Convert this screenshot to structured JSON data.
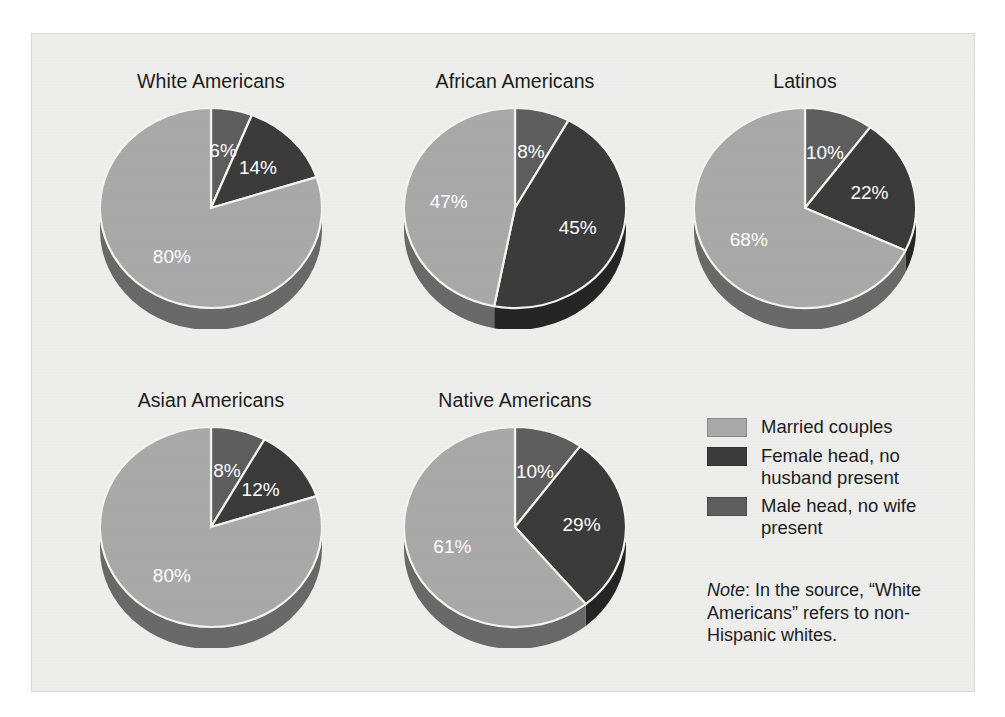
{
  "figure": {
    "background_color": "#eeeeec",
    "legend": {
      "items": [
        {
          "label": "Married couples",
          "color": "#a9a9a9",
          "key": "married"
        },
        {
          "label": "Female head, no husband present",
          "color": "#3b3b3b",
          "key": "female_head"
        },
        {
          "label": "Male head, no wife present",
          "color": "#5e5e5e",
          "key": "male_head"
        }
      ]
    },
    "note": {
      "lead": "Note",
      "text": ": In the source, “White Americans” refers to non-Hispanic whites."
    }
  },
  "chart_data": {
    "type": "pie",
    "title": "",
    "legend_position": "right",
    "categories": [
      "Male head, no wife present",
      "Female head, no husband present",
      "Married couples"
    ],
    "colors": [
      "#5e5e5e",
      "#3b3b3b",
      "#a9a9a9"
    ],
    "unit": "%",
    "charts": [
      {
        "title": "White Americans",
        "slices": [
          {
            "category": "Male head, no wife present",
            "value": 6,
            "label": "6%",
            "color": "#5e5e5e"
          },
          {
            "category": "Female head, no husband present",
            "value": 14,
            "label": "14%",
            "color": "#3b3b3b"
          },
          {
            "category": "Married couples",
            "value": 80,
            "label": "80%",
            "color": "#a9a9a9"
          }
        ]
      },
      {
        "title": "African Americans",
        "slices": [
          {
            "category": "Male head, no wife present",
            "value": 8,
            "label": "8%",
            "color": "#5e5e5e"
          },
          {
            "category": "Female head, no husband present",
            "value": 45,
            "label": "45%",
            "color": "#3b3b3b"
          },
          {
            "category": "Married couples",
            "value": 47,
            "label": "47%",
            "color": "#a9a9a9"
          }
        ]
      },
      {
        "title": "Latinos",
        "slices": [
          {
            "category": "Male head, no wife present",
            "value": 10,
            "label": "10%",
            "color": "#5e5e5e"
          },
          {
            "category": "Female head, no husband present",
            "value": 22,
            "label": "22%",
            "color": "#3b3b3b"
          },
          {
            "category": "Married couples",
            "value": 68,
            "label": "68%",
            "color": "#a9a9a9"
          }
        ]
      },
      {
        "title": "Asian Americans",
        "slices": [
          {
            "category": "Male head, no wife present",
            "value": 8,
            "label": "8%",
            "color": "#5e5e5e"
          },
          {
            "category": "Female head, no husband present",
            "value": 12,
            "label": "12%",
            "color": "#3b3b3b"
          },
          {
            "category": "Married couples",
            "value": 80,
            "label": "80%",
            "color": "#a9a9a9"
          }
        ]
      },
      {
        "title": "Native Americans",
        "slices": [
          {
            "category": "Male head, no wife present",
            "value": 10,
            "label": "10%",
            "color": "#5e5e5e"
          },
          {
            "category": "Female head, no husband present",
            "value": 29,
            "label": "29%",
            "color": "#3b3b3b"
          },
          {
            "category": "Married couples",
            "value": 61,
            "label": "61%",
            "color": "#a9a9a9"
          }
        ]
      }
    ]
  }
}
